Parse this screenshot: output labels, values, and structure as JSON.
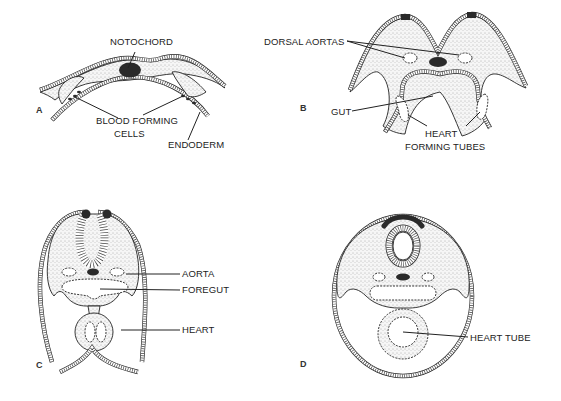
{
  "figure": {
    "panels": [
      {
        "id": "A",
        "label": "A",
        "labels": {
          "notochord": "NOTOCHORD",
          "blood_forming_line1": "BLOOD FORMING",
          "blood_forming_line2": "CELLS",
          "endoderm": "ENDODERM"
        }
      },
      {
        "id": "B",
        "label": "B",
        "labels": {
          "dorsal_aortas": "DORSAL AORTAS",
          "gut": "GUT",
          "heart_forming_line1": "HEART",
          "heart_forming_line2": "FORMING TUBES"
        }
      },
      {
        "id": "C",
        "label": "C",
        "labels": {
          "aorta": "AORTA",
          "foregut": "FOREGUT",
          "heart": "HEART"
        }
      },
      {
        "id": "D",
        "label": "D",
        "labels": {
          "heart_tube": "HEART TUBE"
        }
      }
    ]
  }
}
